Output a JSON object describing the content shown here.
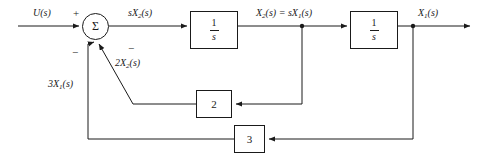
{
  "diagram": {
    "type": "control-block-diagram",
    "stroke_color": "#1a1a1a",
    "background_color": "#ffffff",
    "summing_junction": {
      "symbol": "Σ",
      "name": "summing-junction",
      "signs": {
        "input_plus": "+",
        "feedback_2x2_minus": "−",
        "feedback_3x1_minus": "−"
      }
    },
    "signals": {
      "input": "U(s)",
      "after_sum": "sX",
      "after_sum_sub": "2",
      "after_sum_tail": "(s)",
      "mid_left": "X",
      "mid_left_sub": "2",
      "mid_mid": "(s) = sX",
      "mid_right_sub": "1",
      "mid_tail": "(s)",
      "output": "X",
      "output_sub": "1",
      "output_tail": "(s)",
      "feedback_inner": "2X",
      "feedback_inner_sub": "2",
      "feedback_inner_tail": "(s)",
      "feedback_outer": "3X",
      "feedback_outer_sub": "1",
      "feedback_outer_tail": "(s)"
    },
    "blocks": [
      {
        "name": "integrator-1",
        "numerator": "1",
        "denominator": "s"
      },
      {
        "name": "integrator-2",
        "numerator": "1",
        "denominator": "s"
      },
      {
        "name": "gain-2",
        "label": "2"
      },
      {
        "name": "gain-3",
        "label": "3"
      }
    ]
  }
}
